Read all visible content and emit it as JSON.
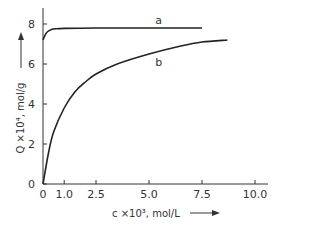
{
  "chart_data": {
    "type": "line",
    "title": "",
    "xlabel": "c ×10³, mol/L",
    "ylabel": "Q ×10⁴, mol/g",
    "xlim": [
      0,
      10.6
    ],
    "ylim": [
      0,
      8.8
    ],
    "x_ticks": [
      "0",
      "1.0",
      "2.5",
      "5.0",
      "7.5",
      "10.0"
    ],
    "x_tick_values": [
      0,
      1.0,
      2.5,
      5.0,
      7.5,
      10.0
    ],
    "y_ticks": [
      "0",
      "2",
      "4",
      "6",
      "8"
    ],
    "y_tick_values": [
      0,
      2,
      4,
      6,
      8
    ],
    "grid": false,
    "legend": "none (curves labeled inline)",
    "series": [
      {
        "name": "a",
        "x": [
          0,
          0.1,
          0.2,
          0.4,
          0.6,
          1.0,
          2.5,
          5.0,
          7.5
        ],
        "values": [
          7.2,
          7.45,
          7.6,
          7.72,
          7.76,
          7.78,
          7.8,
          7.8,
          7.8
        ]
      },
      {
        "name": "b",
        "x": [
          0,
          0.25,
          0.5,
          1.0,
          1.5,
          2.0,
          2.5,
          3.5,
          5.0,
          6.5,
          7.5,
          8.7
        ],
        "values": [
          0,
          1.5,
          2.6,
          3.8,
          4.6,
          5.1,
          5.5,
          6.0,
          6.5,
          6.9,
          7.1,
          7.2
        ]
      }
    ],
    "annotations": [
      {
        "text": "a",
        "x": 5.3,
        "y": 8.0
      },
      {
        "text": "b",
        "x": 5.3,
        "y": 5.9
      }
    ]
  }
}
